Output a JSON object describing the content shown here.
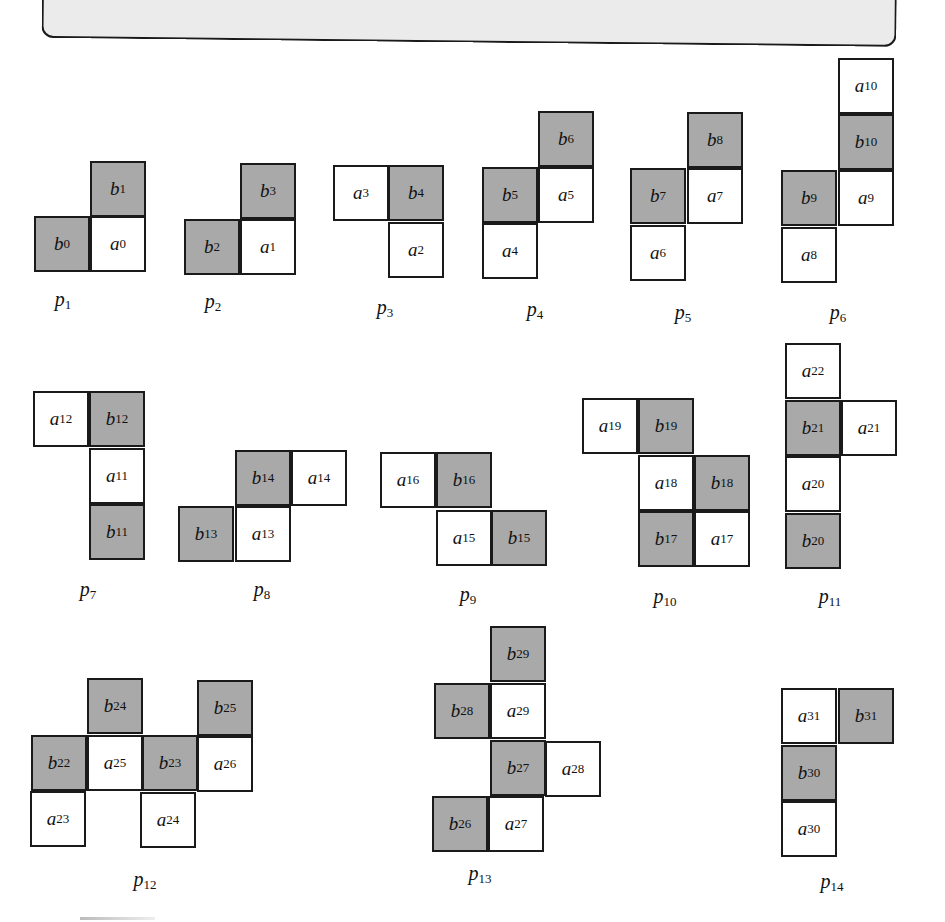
{
  "header_panel": {
    "text": ""
  },
  "colors": {
    "b_cell": "#a9a9a9",
    "a_cell": "#ffffff",
    "border": "#1a1a1a",
    "panel": "#ebebeb"
  },
  "pieces": [
    {
      "label": "p",
      "sub": "1",
      "lx": 63,
      "ly": 288,
      "cells": [
        {
          "type": "b",
          "sub": "1",
          "x": 90,
          "y": 161
        },
        {
          "type": "b",
          "sub": "0",
          "x": 34,
          "y": 216
        },
        {
          "type": "a",
          "sub": "0",
          "x": 90,
          "y": 216
        }
      ]
    },
    {
      "label": "p",
      "sub": "2",
      "lx": 213,
      "ly": 290,
      "cells": [
        {
          "type": "b",
          "sub": "3",
          "x": 240,
          "y": 163
        },
        {
          "type": "b",
          "sub": "2",
          "x": 184,
          "y": 219
        },
        {
          "type": "a",
          "sub": "1",
          "x": 240,
          "y": 219
        }
      ]
    },
    {
      "label": "p",
      "sub": "3",
      "lx": 385,
      "ly": 296,
      "cells": [
        {
          "type": "a",
          "sub": "3",
          "x": 333,
          "y": 165
        },
        {
          "type": "b",
          "sub": "4",
          "x": 388,
          "y": 165
        },
        {
          "type": "a",
          "sub": "2",
          "x": 388,
          "y": 222
        }
      ]
    },
    {
      "label": "p",
      "sub": "4",
      "lx": 535,
      "ly": 298,
      "cells": [
        {
          "type": "b",
          "sub": "6",
          "x": 538,
          "y": 111
        },
        {
          "type": "b",
          "sub": "5",
          "x": 482,
          "y": 167
        },
        {
          "type": "a",
          "sub": "5",
          "x": 538,
          "y": 167
        },
        {
          "type": "a",
          "sub": "4",
          "x": 482,
          "y": 223
        }
      ]
    },
    {
      "label": "p",
      "sub": "5",
      "lx": 683,
      "ly": 301,
      "cells": [
        {
          "type": "b",
          "sub": "8",
          "x": 687,
          "y": 112
        },
        {
          "type": "b",
          "sub": "7",
          "x": 630,
          "y": 168
        },
        {
          "type": "a",
          "sub": "7",
          "x": 687,
          "y": 168
        },
        {
          "type": "a",
          "sub": "6",
          "x": 630,
          "y": 225
        }
      ]
    },
    {
      "label": "p",
      "sub": "6",
      "lx": 838,
      "ly": 301,
      "cells": [
        {
          "type": "a",
          "sub": "10",
          "x": 838,
          "y": 58
        },
        {
          "type": "b",
          "sub": "10",
          "x": 838,
          "y": 114
        },
        {
          "type": "b",
          "sub": "9",
          "x": 781,
          "y": 170
        },
        {
          "type": "a",
          "sub": "9",
          "x": 838,
          "y": 170
        },
        {
          "type": "a",
          "sub": "8",
          "x": 781,
          "y": 227
        }
      ]
    },
    {
      "label": "p",
      "sub": "7",
      "lx": 88,
      "ly": 578,
      "cells": [
        {
          "type": "a",
          "sub": "12",
          "x": 33,
          "y": 391
        },
        {
          "type": "b",
          "sub": "12",
          "x": 89,
          "y": 391
        },
        {
          "type": "a",
          "sub": "11",
          "x": 89,
          "y": 448
        },
        {
          "type": "b",
          "sub": "11",
          "x": 89,
          "y": 504
        }
      ]
    },
    {
      "label": "p",
      "sub": "8",
      "lx": 262,
      "ly": 578,
      "cells": [
        {
          "type": "b",
          "sub": "14",
          "x": 235,
          "y": 450
        },
        {
          "type": "a",
          "sub": "14",
          "x": 291,
          "y": 450
        },
        {
          "type": "b",
          "sub": "13",
          "x": 178,
          "y": 506
        },
        {
          "type": "a",
          "sub": "13",
          "x": 235,
          "y": 506
        }
      ]
    },
    {
      "label": "p",
      "sub": "9",
      "lx": 468,
      "ly": 583,
      "cells": [
        {
          "type": "a",
          "sub": "16",
          "x": 380,
          "y": 452
        },
        {
          "type": "b",
          "sub": "16",
          "x": 436,
          "y": 452
        },
        {
          "type": "a",
          "sub": "15",
          "x": 436,
          "y": 510
        },
        {
          "type": "b",
          "sub": "15",
          "x": 491,
          "y": 510
        }
      ]
    },
    {
      "label": "p",
      "sub": "10",
      "lx": 665,
      "ly": 585,
      "cells": [
        {
          "type": "a",
          "sub": "19",
          "x": 582,
          "y": 398
        },
        {
          "type": "b",
          "sub": "19",
          "x": 638,
          "y": 398
        },
        {
          "type": "a",
          "sub": "18",
          "x": 638,
          "y": 455
        },
        {
          "type": "b",
          "sub": "18",
          "x": 694,
          "y": 455
        },
        {
          "type": "b",
          "sub": "17",
          "x": 638,
          "y": 511
        },
        {
          "type": "a",
          "sub": "17",
          "x": 694,
          "y": 511
        }
      ]
    },
    {
      "label": "p",
      "sub": "11",
      "lx": 830,
      "ly": 585,
      "cells": [
        {
          "type": "a",
          "sub": "22",
          "x": 785,
          "y": 343
        },
        {
          "type": "b",
          "sub": "21",
          "x": 785,
          "y": 400
        },
        {
          "type": "a",
          "sub": "21",
          "x": 841,
          "y": 400
        },
        {
          "type": "a",
          "sub": "20",
          "x": 785,
          "y": 456
        },
        {
          "type": "b",
          "sub": "20",
          "x": 785,
          "y": 513
        }
      ]
    },
    {
      "label": "p",
      "sub": "12",
      "lx": 145,
      "ly": 868,
      "cells": [
        {
          "type": "b",
          "sub": "24",
          "x": 87,
          "y": 678
        },
        {
          "type": "b",
          "sub": "25",
          "x": 197,
          "y": 680
        },
        {
          "type": "b",
          "sub": "22",
          "x": 31,
          "y": 735
        },
        {
          "type": "a",
          "sub": "25",
          "x": 87,
          "y": 735
        },
        {
          "type": "b",
          "sub": "23",
          "x": 142,
          "y": 735
        },
        {
          "type": "a",
          "sub": "26",
          "x": 197,
          "y": 736
        },
        {
          "type": "a",
          "sub": "23",
          "x": 30,
          "y": 791
        },
        {
          "type": "a",
          "sub": "24",
          "x": 140,
          "y": 792
        }
      ]
    },
    {
      "label": "p",
      "sub": "13",
      "lx": 480,
      "ly": 862,
      "cells": [
        {
          "type": "b",
          "sub": "29",
          "x": 490,
          "y": 626
        },
        {
          "type": "b",
          "sub": "28",
          "x": 434,
          "y": 683
        },
        {
          "type": "a",
          "sub": "29",
          "x": 490,
          "y": 683
        },
        {
          "type": "b",
          "sub": "27",
          "x": 490,
          "y": 740
        },
        {
          "type": "a",
          "sub": "28",
          "x": 545,
          "y": 741
        },
        {
          "type": "b",
          "sub": "26",
          "x": 432,
          "y": 796
        },
        {
          "type": "a",
          "sub": "27",
          "x": 488,
          "y": 796
        }
      ]
    },
    {
      "label": "p",
      "sub": "14",
      "lx": 832,
      "ly": 870,
      "cells": [
        {
          "type": "a",
          "sub": "31",
          "x": 781,
          "y": 688
        },
        {
          "type": "b",
          "sub": "31",
          "x": 838,
          "y": 688
        },
        {
          "type": "b",
          "sub": "30",
          "x": 781,
          "y": 745
        },
        {
          "type": "a",
          "sub": "30",
          "x": 781,
          "y": 801
        }
      ]
    }
  ]
}
